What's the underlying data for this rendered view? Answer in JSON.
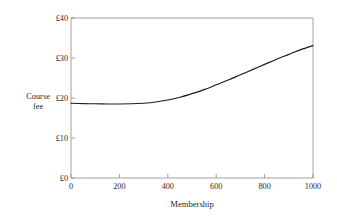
{
  "chart_data": {
    "type": "line",
    "title": "",
    "subtitle": "",
    "xlabel": "Membership",
    "ylabel": "Course fee",
    "ylabel_lines": [
      "Course",
      "fee"
    ],
    "xlim": [
      0,
      1000
    ],
    "ylim": [
      0,
      40
    ],
    "grid": false,
    "legend": false,
    "legend_position": "none",
    "currency_symbol": "£",
    "x_ticks": [
      0,
      200,
      400,
      600,
      800,
      1000
    ],
    "x_tick_labels": [
      "0",
      "200",
      "400",
      "600",
      "800",
      "1000"
    ],
    "y_ticks": [
      0,
      10,
      20,
      30,
      40
    ],
    "y_tick_labels": [
      "£0",
      "£10",
      "£20",
      "£30",
      "£40"
    ],
    "series": [
      {
        "name": "Course fee",
        "color": "#1c1c1c",
        "x": [
          0,
          50,
          100,
          150,
          200,
          250,
          300,
          350,
          400,
          450,
          500,
          550,
          600,
          650,
          700,
          750,
          800,
          850,
          900,
          950,
          1000
        ],
        "values": [
          18.7,
          18.6,
          18.55,
          18.5,
          18.5,
          18.55,
          18.7,
          19.0,
          19.5,
          20.2,
          21.1,
          22.1,
          23.3,
          24.5,
          25.8,
          27.1,
          28.4,
          29.7,
          30.9,
          32.1,
          33.1
        ]
      }
    ],
    "annotations": []
  },
  "figure": {
    "background_color": "#ffffff",
    "axis_color": "#8a8a8a",
    "curve_color": "#1c1c1c",
    "text_color": "#1f1f1f"
  }
}
